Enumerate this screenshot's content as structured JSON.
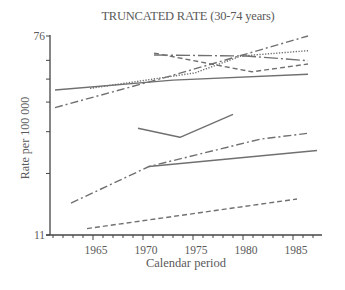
{
  "chart_data": {
    "type": "line",
    "title": "TRUNCATED RATE (30-74 years)",
    "xlabel": "Calendar period",
    "ylabel": "Rate per 100 000",
    "yscale": "log",
    "ylim": [
      11,
      76
    ],
    "xlim": [
      1960.7,
      1987.9
    ],
    "y_tick_labels": [
      "11",
      "76"
    ],
    "y_ticks": [
      11,
      20,
      30,
      40,
      50,
      60,
      76
    ],
    "x_tick_labels": [
      "1965",
      "1970",
      "1975",
      "1980",
      "1985"
    ],
    "x_major_ticks": [
      1965,
      1970,
      1975,
      1980,
      1985
    ],
    "x_minor_tick_step": 1,
    "grid": false,
    "legend": null,
    "series": [
      {
        "name": "series-1",
        "style": "solid",
        "x": [
          1961.2,
          1973.0,
          1986.5
        ],
        "y": [
          45.0,
          49.5,
          52.4
        ]
      },
      {
        "name": "series-2",
        "style": "dashdot",
        "x": [
          1961.2,
          1972.0,
          1986.5
        ],
        "y": [
          37.9,
          50.5,
          76.0
        ]
      },
      {
        "name": "series-3",
        "style": "dotted",
        "x": [
          1964.7,
          1975.2,
          1979.8,
          1986.5
        ],
        "y": [
          45.7,
          53.1,
          62.6,
          65.9
        ]
      },
      {
        "name": "series-4",
        "style": "longdashdot",
        "x": [
          1971.1,
          1980.3,
          1986.5
        ],
        "y": [
          63.2,
          62.6,
          59.8
        ]
      },
      {
        "name": "series-5",
        "style": "dashed",
        "x": [
          1971.1,
          1980.9,
          1986.5
        ],
        "y": [
          64.4,
          53.7,
          57.9
        ]
      },
      {
        "name": "series-6",
        "style": "solid",
        "x": [
          1969.5,
          1973.7,
          1979.0
        ],
        "y": [
          31.0,
          28.4,
          35.5
        ]
      },
      {
        "name": "series-7",
        "style": "dashdot",
        "x": [
          1962.8,
          1970.6,
          1981.7,
          1986.4
        ],
        "y": [
          15.0,
          21.4,
          27.9,
          29.5
        ]
      },
      {
        "name": "series-8",
        "style": "solid",
        "x": [
          1970.6,
          1987.4
        ],
        "y": [
          21.4,
          25.0
        ]
      },
      {
        "name": "series-9",
        "style": "dashed",
        "x": [
          1964.4,
          1985.4
        ],
        "y": [
          11.7,
          15.6
        ]
      }
    ],
    "colors": {
      "line": "#707070",
      "axis": "#444444",
      "text": "#5a5a5a"
    }
  }
}
